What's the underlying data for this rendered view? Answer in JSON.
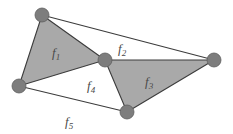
{
  "figure": {
    "type": "planar-graph-diagram",
    "width": 233,
    "height": 134,
    "background_color": "#ffffff"
  },
  "colors": {
    "face_shaded_fill": "#a9a9a9",
    "face_unshaded_fill": "#ffffff",
    "edge_stroke": "#3c3c3c",
    "vertex_fill": "#7d7d7d",
    "vertex_stroke": "#5e5e5e",
    "label_color": "#4a4a4a"
  },
  "vertices": [
    {
      "id": "v1",
      "name": "top-left-vertex",
      "x": 42,
      "y": 15,
      "r": 7
    },
    {
      "id": "v2",
      "name": "left-vertex",
      "x": 19,
      "y": 86,
      "r": 7
    },
    {
      "id": "v3",
      "name": "center-vertex",
      "x": 105,
      "y": 60,
      "r": 7
    },
    {
      "id": "v4",
      "name": "right-vertex",
      "x": 214,
      "y": 60,
      "r": 7
    },
    {
      "id": "v5",
      "name": "bottom-vertex",
      "x": 127,
      "y": 112,
      "r": 7
    }
  ],
  "edges": [
    {
      "id": "e1",
      "name": "edge-top-left-to-left",
      "from": "v1",
      "to": "v2"
    },
    {
      "id": "e2",
      "name": "edge-top-left-to-center",
      "from": "v1",
      "to": "v3"
    },
    {
      "id": "e3",
      "name": "edge-top-left-to-right",
      "from": "v1",
      "to": "v4"
    },
    {
      "id": "e4",
      "name": "edge-left-to-center",
      "from": "v2",
      "to": "v3"
    },
    {
      "id": "e5",
      "name": "edge-left-to-bottom",
      "from": "v2",
      "to": "v5"
    },
    {
      "id": "e6",
      "name": "edge-center-to-right",
      "from": "v3",
      "to": "v4"
    },
    {
      "id": "e7",
      "name": "edge-center-to-bottom",
      "from": "v3",
      "to": "v5"
    },
    {
      "id": "e8",
      "name": "edge-right-to-bottom",
      "from": "v4",
      "to": "v5"
    }
  ],
  "faces": [
    {
      "id": "f1",
      "label": "f",
      "subscript": "1",
      "name": "face-f1",
      "shaded": true,
      "vertices": [
        "v1",
        "v2",
        "v3"
      ],
      "polygon": "42,15 19,86 105,60",
      "label_x": 52,
      "label_y": 57
    },
    {
      "id": "f2",
      "label": "f",
      "subscript": "2",
      "name": "face-f2",
      "shaded": false,
      "vertices": [
        "v1",
        "v3",
        "v4"
      ],
      "polygon": "42,15 105,60 214,60",
      "label_x": 118,
      "label_y": 53
    },
    {
      "id": "f3",
      "label": "f",
      "subscript": "3",
      "name": "face-f3",
      "shaded": true,
      "vertices": [
        "v3",
        "v4",
        "v5"
      ],
      "polygon": "105,60 214,60 127,112",
      "label_x": 145,
      "label_y": 86
    },
    {
      "id": "f4",
      "label": "f",
      "subscript": "4",
      "name": "face-f4",
      "shaded": false,
      "vertices": [
        "v2",
        "v3",
        "v5"
      ],
      "polygon": "19,86 105,60 127,112",
      "label_x": 87,
      "label_y": 90
    },
    {
      "id": "f5",
      "label": "f",
      "subscript": "5",
      "name": "face-f5-outer",
      "shaded": false,
      "vertices": [
        "v2",
        "v5",
        "v4",
        "v1"
      ],
      "polygon": "",
      "label_x": 65,
      "label_y": 126
    }
  ]
}
